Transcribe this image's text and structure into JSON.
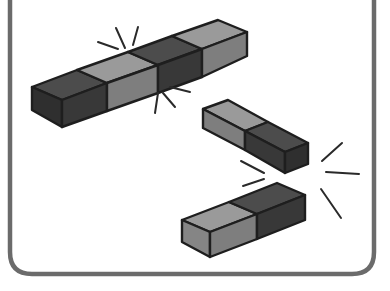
{
  "illustration": {
    "title": "Magnetic blocks snapping together",
    "description": "A long segmented bar of four blocks joined with spark lines, and two two-segment blocks being pulled together with spark lines",
    "colors": {
      "frame": "#6b6b6b",
      "outline": "#1e1e1e",
      "dark_top": "#4c4c4c",
      "dark_front": "#383838",
      "dark_end": "#2f2f2f",
      "light_top": "#9a9a9a",
      "light_front": "#7e7e7e",
      "light_end": "#858585",
      "background": "#ffffff"
    },
    "objects": [
      {
        "name": "long-bar",
        "segments": [
          "dark",
          "light",
          "dark",
          "light"
        ]
      },
      {
        "name": "upper-right-block",
        "segments": [
          "light",
          "dark"
        ]
      },
      {
        "name": "lower-block",
        "segments": [
          "light",
          "dark"
        ]
      }
    ],
    "spark_groups": 3
  }
}
